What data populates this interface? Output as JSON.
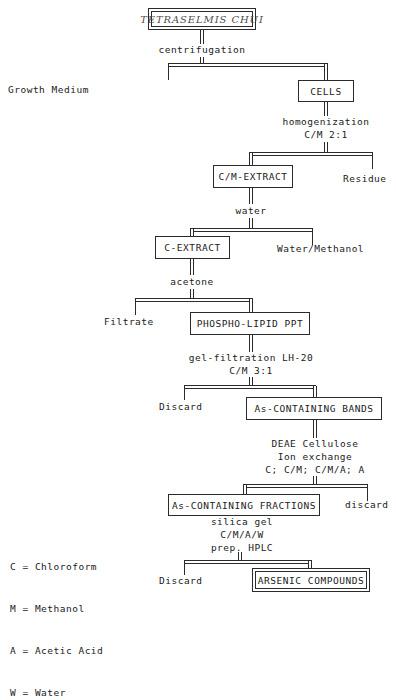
{
  "diagram": {
    "title": "TETRASELMIS CHUI",
    "nodes": {
      "organism": "TETRASELMIS CHUI",
      "cells": "CELLS",
      "cm_extract": "C/M-EXTRACT",
      "c_extract": "C-EXTRACT",
      "ppt": "PHOSPHO-LIPID PPT",
      "bands": "As-CONTAINING BANDS",
      "fractions": "As-CONTAINING FRACTIONS",
      "final": "ARSENIC COMPOUNDS"
    },
    "processes": {
      "centrifugation": "centrifugation",
      "homogenization1": "homogenization",
      "homogenization2": "C/M 2:1",
      "water": "water",
      "acetone": "acetone",
      "gelfilt1": "gel-filtration LH-20",
      "gelfilt2": "C/M 3:1",
      "deae1": "DEAE Cellulose",
      "deae2": "Ion exchange",
      "deae3": "C; C/M; C/M/A; A",
      "hplc1": "silica gel",
      "hplc2": "C/M/A/W",
      "hplc3": "prep. HPLC"
    },
    "byproducts": {
      "growth_medium": "Growth Medium",
      "residue": "Residue",
      "water_methanol": "Water/Methanol",
      "filtrate": "Filtrate",
      "discard_bands": "Discard",
      "discard_frac": "discard",
      "discard_final": "Discard"
    },
    "legend": {
      "c": "C = Chloroform",
      "m": "M = Methanol",
      "a": "A = Acetic Acid",
      "w": "W = Water"
    },
    "colors": {
      "ink": "#2b2b2b",
      "background": "#ffffff",
      "title_ink": "#4d4d4d"
    }
  }
}
